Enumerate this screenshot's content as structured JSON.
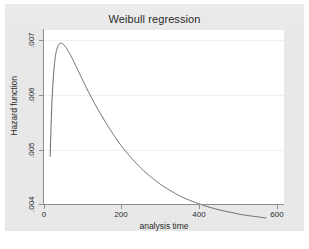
{
  "figure": {
    "background_color": "#e8e8e8",
    "plot_background_color": "#ffffff",
    "axis_color": "#8f8f8f",
    "grid_color": "#f0f0f0",
    "curve_color": "#4a4a4a"
  },
  "chart_data": {
    "type": "line",
    "title": "Weibull regression",
    "xlabel": "analysis time",
    "ylabel": "Hazard function",
    "xlim": [
      -12,
      612
    ],
    "ylim": [
      0.00385,
      0.00735
    ],
    "xticks": [
      0,
      200,
      400,
      600
    ],
    "xtick_labels": [
      "0",
      "200",
      "400",
      "600"
    ],
    "yticks": [
      0.004,
      0.005,
      0.006,
      0.007
    ],
    "ytick_labels": [
      ".004",
      ".005",
      ".006",
      ".007"
    ],
    "grid": "horizontal",
    "legend": null,
    "series": [
      {
        "name": "Hazard function",
        "x": [
          4,
          8,
          12,
          16,
          20,
          25,
          30,
          35,
          40,
          45,
          50,
          60,
          70,
          80,
          90,
          100,
          115,
          130,
          150,
          170,
          190,
          210,
          230,
          250,
          270,
          290,
          310,
          330,
          350,
          375,
          400,
          425,
          450,
          475,
          500,
          525,
          545,
          565
        ],
        "y": [
          0.00481,
          0.00578,
          0.00636,
          0.00672,
          0.00692,
          0.00704,
          0.00708,
          0.00708,
          0.00705,
          0.007,
          0.00694,
          0.0068,
          0.00664,
          0.00648,
          0.00632,
          0.00616,
          0.00594,
          0.00573,
          0.00547,
          0.00523,
          0.00501,
          0.00482,
          0.00465,
          0.0045,
          0.00437,
          0.00425,
          0.00415,
          0.00406,
          0.00398,
          0.0039,
          0.00383,
          0.00377,
          0.00372,
          0.00368,
          0.00364,
          0.00361,
          0.00359,
          0.00357
        ]
      }
    ]
  }
}
